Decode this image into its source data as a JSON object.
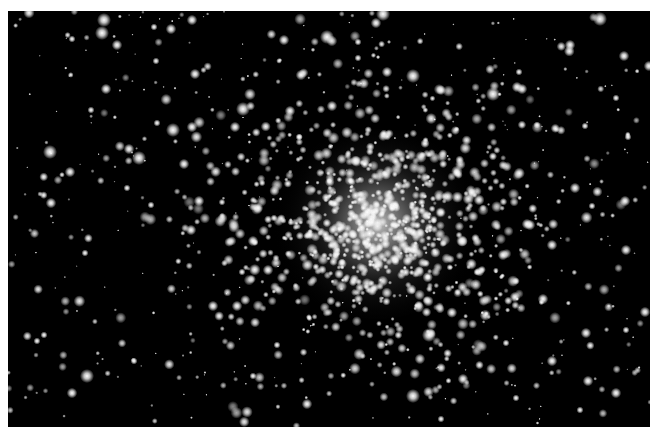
{
  "image": {
    "subject": "globular star cluster",
    "description": "Dense globular cluster of white stars on a black sky, concentrated core slightly right of center with scattered field stars",
    "colors": {
      "sky": "#000000",
      "star": "#ffffff",
      "border": "#ffffff"
    },
    "frame": {
      "left": 8,
      "top": 11,
      "width": 642,
      "height": 416
    },
    "core": {
      "x": 377,
      "y": 224,
      "radius": 95
    },
    "bright_stars": [
      [
        104,
        20,
        4
      ],
      [
        102,
        33,
        4
      ],
      [
        117,
        45,
        3
      ],
      [
        72,
        39,
        2
      ],
      [
        106,
        89,
        3
      ],
      [
        173,
        130,
        4
      ],
      [
        157,
        123,
        2
      ],
      [
        192,
        20,
        3
      ],
      [
        171,
        29,
        3
      ],
      [
        154,
        27,
        2
      ],
      [
        192,
        127,
        3
      ],
      [
        195,
        74,
        3
      ],
      [
        156,
        61,
        2
      ],
      [
        91,
        110,
        2
      ],
      [
        50,
        152,
        4
      ],
      [
        70,
        172,
        3
      ],
      [
        51,
        203,
        3
      ],
      [
        129,
        149,
        3
      ],
      [
        139,
        158,
        4
      ],
      [
        127,
        188,
        2
      ],
      [
        151,
        205,
        2
      ],
      [
        85,
        253,
        2
      ],
      [
        191,
        230,
        3
      ],
      [
        184,
        164,
        3
      ],
      [
        199,
        201,
        3
      ],
      [
        87,
        376,
        4
      ],
      [
        72,
        393,
        3
      ],
      [
        134,
        361,
        2
      ],
      [
        213,
        306,
        3
      ],
      [
        237,
        306,
        3
      ],
      [
        44,
        335,
        2
      ],
      [
        37,
        341,
        2
      ],
      [
        383,
        14,
        4
      ],
      [
        376,
        23,
        3
      ],
      [
        327,
        37,
        4
      ],
      [
        284,
        40,
        3
      ],
      [
        358,
        42,
        2
      ],
      [
        413,
        76,
        4
      ],
      [
        387,
        72,
        3
      ],
      [
        358,
        58,
        2
      ],
      [
        332,
        106,
        3
      ],
      [
        301,
        75,
        3
      ],
      [
        243,
        109,
        4
      ],
      [
        290,
        111,
        3
      ],
      [
        235,
        127,
        3
      ],
      [
        299,
        137,
        2
      ],
      [
        600,
        19,
        4
      ],
      [
        570,
        45,
        3
      ],
      [
        624,
        56,
        3
      ],
      [
        649,
        66,
        3
      ],
      [
        522,
        89,
        3
      ],
      [
        493,
        94,
        4
      ],
      [
        519,
        72,
        2
      ],
      [
        517,
        87,
        3
      ],
      [
        616,
        98,
        2
      ],
      [
        585,
        126,
        2
      ],
      [
        628,
        137,
        2
      ],
      [
        537,
        125,
        2
      ],
      [
        626,
        250,
        3
      ],
      [
        530,
        225,
        3
      ],
      [
        527,
        224,
        3
      ],
      [
        552,
        245,
        3
      ],
      [
        575,
        188,
        3
      ],
      [
        592,
        206,
        2
      ],
      [
        625,
        201,
        3
      ],
      [
        645,
        312,
        3
      ],
      [
        586,
        333,
        3
      ],
      [
        626,
        330,
        2
      ],
      [
        588,
        381,
        3
      ],
      [
        616,
        393,
        3
      ],
      [
        580,
        410,
        2
      ],
      [
        503,
        255,
        3
      ],
      [
        515,
        297,
        3
      ],
      [
        543,
        299,
        3
      ],
      [
        413,
        396,
        4
      ],
      [
        307,
        404,
        3
      ],
      [
        463,
        379,
        3
      ],
      [
        429,
        335,
        4
      ],
      [
        441,
        419,
        2
      ],
      [
        516,
        398,
        2
      ],
      [
        552,
        361,
        3
      ],
      [
        506,
        343,
        2
      ],
      [
        277,
        345,
        2
      ],
      [
        253,
        376,
        2
      ],
      [
        253,
        241,
        3
      ],
      [
        268,
        270,
        3
      ],
      [
        242,
        272,
        2
      ],
      [
        258,
        208,
        3
      ],
      [
        274,
        218,
        2
      ]
    ],
    "field_star_count": 420,
    "cluster_star_count": 900
  }
}
